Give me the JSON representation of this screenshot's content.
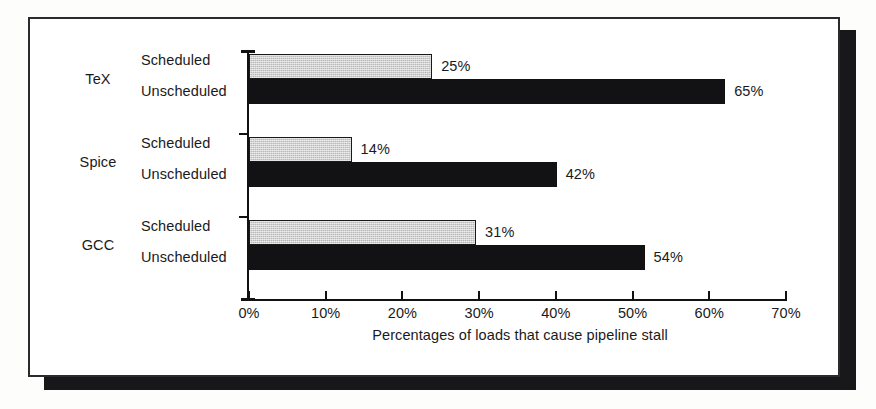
{
  "chart_data": {
    "type": "bar",
    "orientation": "horizontal",
    "title": "",
    "xlabel": "Percentages of loads that cause pipeline stall",
    "ylabel": "",
    "xlim": [
      0,
      70
    ],
    "xticks": [
      "0%",
      "10%",
      "20%",
      "30%",
      "40%",
      "50%",
      "60%",
      "70%"
    ],
    "xtick_values": [
      0,
      10,
      20,
      30,
      40,
      50,
      60,
      70
    ],
    "grid": false,
    "legend": "none",
    "groups": [
      {
        "name": "TeX",
        "bars": [
          {
            "series": "Scheduled",
            "value": 25,
            "label": "25%",
            "style": "gray"
          },
          {
            "series": "Unscheduled",
            "value": 65,
            "label": "65%",
            "style": "black"
          }
        ]
      },
      {
        "name": "Spice",
        "bars": [
          {
            "series": "Scheduled",
            "value": 14,
            "label": "14%",
            "style": "gray"
          },
          {
            "series": "Unscheduled",
            "value": 42,
            "label": "42%",
            "style": "black"
          }
        ]
      },
      {
        "name": "GCC",
        "bars": [
          {
            "series": "Scheduled",
            "value": 31,
            "label": "31%",
            "style": "gray"
          },
          {
            "series": "Unscheduled",
            "value": 54,
            "label": "54%",
            "style": "black"
          }
        ]
      }
    ],
    "colors": {
      "scheduled": "#b9b9b9",
      "unscheduled": "#121214",
      "axis": "#111113",
      "text": "#1a1a1c",
      "frame": "#2b2b2d",
      "shadow": "#18181a",
      "background": "#ffffff"
    }
  },
  "figure": {
    "group_names": [
      "TeX",
      "Spice",
      "GCC"
    ],
    "series_names": [
      "Scheduled",
      "Unscheduled"
    ]
  }
}
